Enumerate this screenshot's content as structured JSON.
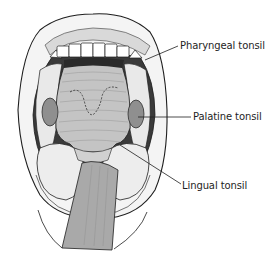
{
  "figure": {
    "style": "grayscale pen-and-ink anatomical illustration",
    "colors": {
      "background": "#ffffff",
      "ink": "#1e1e1e",
      "tongue_depressor": "#a9a9a9",
      "pharynx_wall": "#b8b8b8",
      "throat_shadow": "#3a3a3a",
      "lip_fill": "#f2f2f2",
      "tonsil_fill": "#8f8f8f"
    }
  },
  "labels": [
    {
      "id": "pharyngeal",
      "text": "Pharyngeal tonsil"
    },
    {
      "id": "palatine",
      "text": "Palatine tonsil"
    },
    {
      "id": "lingual",
      "text": "Lingual tonsil"
    }
  ]
}
